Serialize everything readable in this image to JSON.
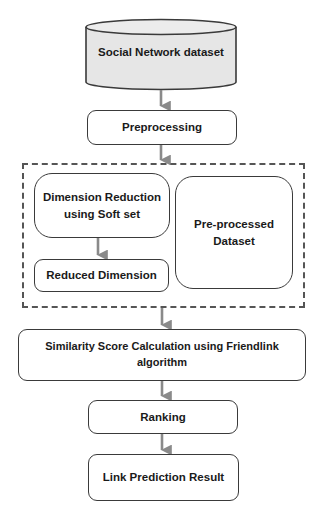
{
  "diagram": {
    "nodes": {
      "dataset": {
        "label": "Social Network dataset",
        "shape": "cylinder"
      },
      "preprocessing": {
        "label": "Preprocessing"
      },
      "dimension_reduction": {
        "label": "Dimension Reduction using Soft set",
        "line1": "Dimension Reduction",
        "line2": "using Soft set"
      },
      "reduced_dimension": {
        "label": "Reduced Dimension"
      },
      "preprocessed_dataset": {
        "label": "Pre-processed Dataset",
        "line1": "Pre-processed",
        "line2": "Dataset"
      },
      "similarity": {
        "label": "Similarity Score Calculation using Friendlink algorithm"
      },
      "ranking": {
        "label": "Ranking"
      },
      "result": {
        "label": "Link Prediction Result"
      }
    },
    "group": {
      "style": "dashed",
      "contains": [
        "dimension_reduction",
        "reduced_dimension",
        "preprocessed_dataset"
      ]
    },
    "edges": [
      [
        "dataset",
        "preprocessing"
      ],
      [
        "preprocessing",
        "group"
      ],
      [
        "dimension_reduction",
        "reduced_dimension"
      ],
      [
        "group",
        "similarity"
      ],
      [
        "similarity",
        "ranking"
      ],
      [
        "ranking",
        "result"
      ]
    ],
    "colors": {
      "cylinder_fill": "#e6e6e6",
      "stroke": "#3a3a3a",
      "arrow": "#8a8a8a",
      "dashed_border": "#555555"
    }
  }
}
